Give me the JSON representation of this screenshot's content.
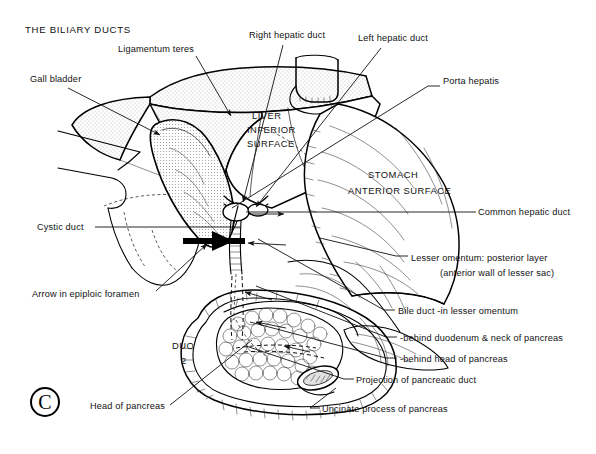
{
  "figure": {
    "title": "THE BILIARY DUCTS",
    "panel_letter": "C"
  },
  "organ_labels": [
    {
      "name": "liver-inferior-surface",
      "lines": [
        "LIVER",
        "INFERIOR",
        "SURFACE"
      ],
      "x": 252,
      "y": 119
    },
    {
      "name": "stomach-anterior-surface",
      "lines": [
        "STOMACH",
        "ANTERIOR SURFACE"
      ],
      "x": 395,
      "y": 176
    },
    {
      "name": "duodenum-part-2",
      "lines": [
        "DUO",
        "2"
      ],
      "x": 183,
      "y": 348
    }
  ],
  "callouts": [
    {
      "name": "gall-bladder",
      "text": "Gall bladder",
      "x": 30,
      "y": 82
    },
    {
      "name": "ligamentum-teres",
      "text": "Ligamentum teres",
      "x": 118,
      "y": 52
    },
    {
      "name": "right-hepatic-duct",
      "text": "Right hepatic duct",
      "x": 249,
      "y": 38
    },
    {
      "name": "left-hepatic-duct",
      "text": "Left hepatic duct",
      "x": 358,
      "y": 41
    },
    {
      "name": "porta-hepatis",
      "text": "Porta hepatis",
      "x": 443,
      "y": 84
    },
    {
      "name": "cystic-duct",
      "text": "Cystic duct",
      "x": 37,
      "y": 230
    },
    {
      "name": "arrow-in-epiploic-foramen",
      "text": "Arrow in epiploic foramen",
      "x": 32,
      "y": 297
    },
    {
      "name": "head-of-pancreas",
      "text": "Head of pancreas",
      "x": 90,
      "y": 409
    },
    {
      "name": "common-hepatic-duct",
      "text": "Common hepatic duct",
      "x": 478,
      "y": 215
    },
    {
      "name": "lesser-omentum-posterior-layer",
      "text": "Lesser omentum: posterior layer",
      "x": 411,
      "y": 261
    },
    {
      "name": "lesser-omentum-anterior-wall",
      "text": "(anterior wall of lesser sac)",
      "x": 440,
      "y": 275
    },
    {
      "name": "bile-duct-in-lesser-omentum",
      "text": "Bile duct -in lesser omentum",
      "x": 398,
      "y": 314
    },
    {
      "name": "behind-duodenum-neck-of-pancreas",
      "text": "-behind duodenum & neck of pancreas",
      "x": 400,
      "y": 341
    },
    {
      "name": "behind-head-of-pancreas",
      "text": "-behind head of pancreas",
      "x": 400,
      "y": 362
    },
    {
      "name": "projection-of-pancreatic-duct",
      "text": "Projection of pancreatic duct",
      "x": 356,
      "y": 383
    },
    {
      "name": "uncinate-process-of-pancreas",
      "text": "Uncinate process of pancreas",
      "x": 322,
      "y": 412
    }
  ],
  "colors": {
    "ink": "#111111",
    "stipple": "#c9c9c9",
    "paper": "#ffffff"
  }
}
